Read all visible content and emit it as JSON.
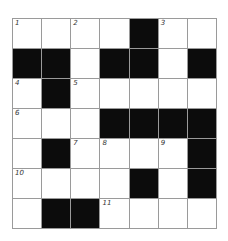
{
  "puzzle": {
    "rows": 7,
    "cols": 7,
    "colors": {
      "block": "#0c0c0c",
      "cell": "#ffffff",
      "gridline": "#9a9a9a"
    },
    "grid": [
      [
        {
          "b": false,
          "n": "1"
        },
        {
          "b": false,
          "n": ""
        },
        {
          "b": false,
          "n": "2"
        },
        {
          "b": false,
          "n": ""
        },
        {
          "b": true,
          "n": ""
        },
        {
          "b": false,
          "n": "3"
        },
        {
          "b": false,
          "n": ""
        }
      ],
      [
        {
          "b": true,
          "n": ""
        },
        {
          "b": true,
          "n": ""
        },
        {
          "b": false,
          "n": ""
        },
        {
          "b": true,
          "n": ""
        },
        {
          "b": true,
          "n": ""
        },
        {
          "b": false,
          "n": ""
        },
        {
          "b": true,
          "n": ""
        }
      ],
      [
        {
          "b": false,
          "n": "4"
        },
        {
          "b": true,
          "n": ""
        },
        {
          "b": false,
          "n": "5"
        },
        {
          "b": false,
          "n": ""
        },
        {
          "b": false,
          "n": ""
        },
        {
          "b": false,
          "n": ""
        },
        {
          "b": false,
          "n": ""
        }
      ],
      [
        {
          "b": false,
          "n": "6"
        },
        {
          "b": false,
          "n": ""
        },
        {
          "b": false,
          "n": ""
        },
        {
          "b": true,
          "n": ""
        },
        {
          "b": true,
          "n": ""
        },
        {
          "b": true,
          "n": ""
        },
        {
          "b": true,
          "n": ""
        }
      ],
      [
        {
          "b": false,
          "n": ""
        },
        {
          "b": true,
          "n": ""
        },
        {
          "b": false,
          "n": "7"
        },
        {
          "b": false,
          "n": "8"
        },
        {
          "b": false,
          "n": ""
        },
        {
          "b": false,
          "n": "9"
        },
        {
          "b": true,
          "n": ""
        }
      ],
      [
        {
          "b": false,
          "n": "10"
        },
        {
          "b": false,
          "n": ""
        },
        {
          "b": false,
          "n": ""
        },
        {
          "b": false,
          "n": ""
        },
        {
          "b": true,
          "n": ""
        },
        {
          "b": false,
          "n": ""
        },
        {
          "b": true,
          "n": ""
        }
      ],
      [
        {
          "b": false,
          "n": ""
        },
        {
          "b": true,
          "n": ""
        },
        {
          "b": true,
          "n": ""
        },
        {
          "b": false,
          "n": "11"
        },
        {
          "b": false,
          "n": ""
        },
        {
          "b": false,
          "n": ""
        },
        {
          "b": false,
          "n": ""
        }
      ]
    ]
  }
}
